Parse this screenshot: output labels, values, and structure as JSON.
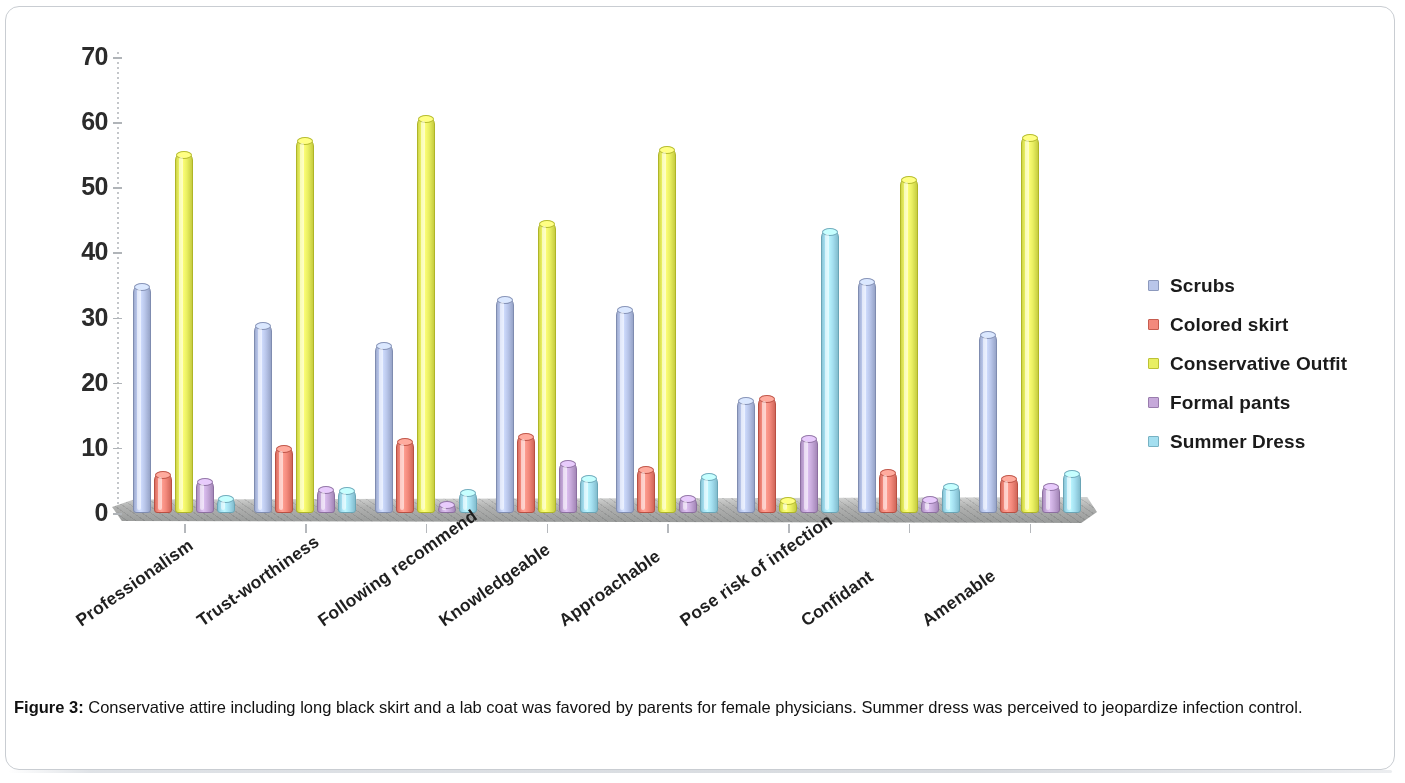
{
  "figure": {
    "caption_label": "Figure 3:",
    "caption_text": " Conservative attire including long black skirt and a lab coat was favored by parents for female physicians. Summer dress was perceived to jeopardize infection control."
  },
  "legend": {
    "position": "right",
    "items": [
      {
        "label": "Scrubs",
        "color": "#b9c6ea"
      },
      {
        "label": "Colored skirt",
        "color": "#f3897c"
      },
      {
        "label": "Conservative Outfit",
        "color": "#e9ef62"
      },
      {
        "label": "Formal pants",
        "color": "#c6a9da"
      },
      {
        "label": "Summer Dress",
        "color": "#a4dff0"
      }
    ]
  },
  "axis": {
    "y_ticks": [
      "70",
      "60",
      "50",
      "40",
      "30",
      "20",
      "10",
      "0"
    ],
    "y_min": 0,
    "y_max": 70,
    "y_step": 10
  },
  "chart_data": {
    "type": "bar",
    "title": "",
    "subtitle": "",
    "xlabel": "",
    "ylabel": "",
    "ylim": [
      0,
      70
    ],
    "ytick_step": 10,
    "grid": false,
    "legend_position": "right",
    "style": "3d-cylinder-clustered",
    "categories": [
      "Professionalism",
      "Trust-worthiness",
      "Following recommend",
      "Knowledgeable",
      "Approachable",
      "Pose risk of infection",
      "Confidant",
      "Amenable"
    ],
    "series": [
      {
        "name": "Scrubs",
        "color": "#b9c6ea",
        "values": [
          35.0,
          29.0,
          26.0,
          33.0,
          31.5,
          17.5,
          35.7,
          27.7
        ]
      },
      {
        "name": "Colored skirt",
        "color": "#f3897c",
        "values": [
          6.2,
          10.2,
          11.2,
          12.0,
          6.9,
          17.8,
          6.5,
          5.5
        ]
      },
      {
        "name": "Conservative Outfit",
        "color": "#e9ef62",
        "values": [
          55.2,
          57.4,
          60.8,
          44.6,
          56.0,
          2.1,
          51.5,
          57.9
        ]
      },
      {
        "name": "Formal pants",
        "color": "#c6a9da",
        "values": [
          5.0,
          3.9,
          1.5,
          7.9,
          2.5,
          11.7,
          2.3,
          4.3
        ]
      },
      {
        "name": "Summer Dress",
        "color": "#a4dff0",
        "values": [
          2.5,
          3.7,
          3.4,
          5.5,
          5.8,
          43.5,
          4.3,
          6.3
        ]
      }
    ]
  }
}
